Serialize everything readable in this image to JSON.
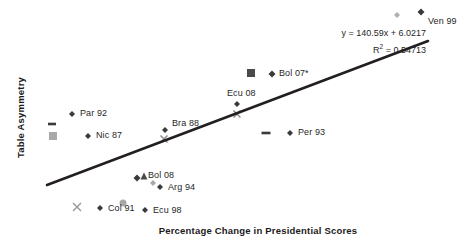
{
  "chart_data": {
    "type": "scatter",
    "title": "",
    "xlabel": "Percentage Change in Presidential Scores",
    "ylabel": "Table Asymmetry",
    "grid": false,
    "legend": "none",
    "axes_visible": false,
    "trendline": {
      "equation": "y = 140.59x + 6.0217",
      "r2_label": "R",
      "r2_sup": "2",
      "r2_value": " = 0.54713",
      "slope": 140.59,
      "intercept": 6.0217,
      "r_squared": 0.54713,
      "color": "#231f20",
      "x_start_px": 47,
      "y_start_px": 185,
      "x_end_px": 428,
      "y_end_px": 41
    },
    "points": [
      {
        "label": "Ven 99",
        "marker": "diamond",
        "color": "#3a3a3a",
        "size": 7,
        "x": 421,
        "y": 12,
        "label_x": 428,
        "label_y": 16,
        "label_anchor": "start"
      },
      {
        "label": "",
        "marker": "diamond",
        "color": "#b0b0b0",
        "size": 6,
        "x": 397,
        "y": 15,
        "label_x": 0,
        "label_y": 0,
        "label_anchor": "start"
      },
      {
        "label": "",
        "marker": "square",
        "color": "#4a4a4a",
        "size": 8,
        "x": 251,
        "y": 73,
        "label_x": 0,
        "label_y": 0,
        "label_anchor": "start"
      },
      {
        "label": "Bol 07*",
        "marker": "diamond",
        "color": "#3a3a3a",
        "size": 7,
        "x": 272,
        "y": 74,
        "label_x": 279,
        "label_y": 68,
        "label_anchor": "start"
      },
      {
        "label": "Ecu 08",
        "marker": "diamond",
        "color": "#3a3a3a",
        "size": 6,
        "x": 237,
        "y": 104,
        "label_x": 227,
        "label_y": 88,
        "label_anchor": "start"
      },
      {
        "label": "",
        "marker": "x",
        "color": "#8c8c8c",
        "size": 7,
        "x": 237,
        "y": 114,
        "label_x": 0,
        "label_y": 0,
        "label_anchor": "start"
      },
      {
        "label": "Par 92",
        "marker": "diamond",
        "color": "#3a3a3a",
        "size": 6,
        "x": 72,
        "y": 114,
        "label_x": 80,
        "label_y": 108,
        "label_anchor": "start"
      },
      {
        "label": "",
        "marker": "dash",
        "color": "#3a3a3a",
        "size": 8,
        "x": 52,
        "y": 124,
        "label_x": 0,
        "label_y": 0,
        "label_anchor": "start"
      },
      {
        "label": "",
        "marker": "square",
        "color": "#a8a8a8",
        "size": 8,
        "x": 53,
        "y": 136,
        "label_x": 0,
        "label_y": 0,
        "label_anchor": "start"
      },
      {
        "label": "Nic 87",
        "marker": "diamond",
        "color": "#3a3a3a",
        "size": 6,
        "x": 88,
        "y": 136,
        "label_x": 96,
        "label_y": 130,
        "label_anchor": "start"
      },
      {
        "label": "Bra 88",
        "marker": "diamond",
        "color": "#3a3a3a",
        "size": 6,
        "x": 165,
        "y": 130,
        "label_x": 172,
        "label_y": 118,
        "label_anchor": "start"
      },
      {
        "label": "",
        "marker": "x",
        "color": "#8c8c8c",
        "size": 7,
        "x": 164,
        "y": 139,
        "label_x": 0,
        "label_y": 0,
        "label_anchor": "start"
      },
      {
        "label": "",
        "marker": "dash",
        "color": "#3a3a3a",
        "size": 9,
        "x": 266,
        "y": 133,
        "label_x": 0,
        "label_y": 0,
        "label_anchor": "start"
      },
      {
        "label": "Per 93",
        "marker": "diamond",
        "color": "#3a3a3a",
        "size": 6,
        "x": 290,
        "y": 133,
        "label_x": 298,
        "label_y": 127,
        "label_anchor": "start"
      },
      {
        "label": "Bol 08",
        "marker": "diamond",
        "color": "#3a3a3a",
        "size": 7,
        "x": 137,
        "y": 178,
        "label_x": 148,
        "label_y": 170,
        "label_anchor": "start"
      },
      {
        "label": "",
        "marker": "triangle",
        "color": "#4a4a4a",
        "size": 7,
        "x": 144,
        "y": 176,
        "label_x": 0,
        "label_y": 0,
        "label_anchor": "start"
      },
      {
        "label": "",
        "marker": "diamond",
        "color": "#a8a8a8",
        "size": 6,
        "x": 153,
        "y": 183,
        "label_x": 0,
        "label_y": 0,
        "label_anchor": "start"
      },
      {
        "label": "Arg 94",
        "marker": "diamond",
        "color": "#3a3a3a",
        "size": 6,
        "x": 160,
        "y": 187,
        "label_x": 168,
        "label_y": 182,
        "label_anchor": "start"
      },
      {
        "label": "",
        "marker": "x",
        "color": "#9a9a9a",
        "size": 8,
        "x": 77,
        "y": 207,
        "label_x": 0,
        "label_y": 0,
        "label_anchor": "start"
      },
      {
        "label": "Col 91",
        "marker": "diamond",
        "color": "#3a3a3a",
        "size": 6,
        "x": 100,
        "y": 208,
        "label_x": 108,
        "label_y": 203,
        "label_anchor": "start"
      },
      {
        "label": "",
        "marker": "circle",
        "color": "#a8a8a8",
        "size": 7,
        "x": 123,
        "y": 203,
        "label_x": 0,
        "label_y": 0,
        "label_anchor": "start"
      },
      {
        "label": "Ecu 98",
        "marker": "diamond",
        "color": "#3a3a3a",
        "size": 6,
        "x": 145,
        "y": 210,
        "label_x": 153,
        "label_y": 205,
        "label_anchor": "start"
      }
    ]
  }
}
